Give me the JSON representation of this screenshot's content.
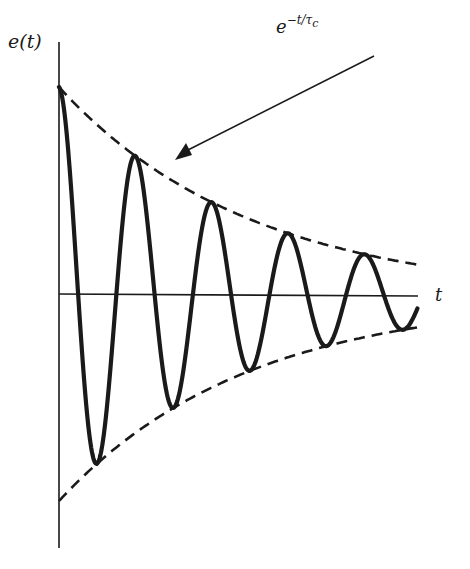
{
  "diagram": {
    "y_axis_label": "e(t)",
    "x_axis_label": "t",
    "envelope_label": {
      "base": "e",
      "exponent": "−t/τ",
      "subscript": "c"
    },
    "colors": {
      "stroke": "#1a1a1a",
      "background": "#ffffff"
    }
  },
  "chart_data": {
    "type": "line",
    "title": "",
    "xlabel": "t",
    "ylabel": "e(t)",
    "series": [
      {
        "name": "e(t) damped cosine",
        "style": "solid-thick"
      },
      {
        "name": "upper envelope e^(-t/τc)",
        "style": "dashed"
      },
      {
        "name": "lower envelope -e^(-t/τc)",
        "style": "dashed"
      }
    ],
    "peaks_relative_amplitude": [
      1.0,
      0.71,
      0.52,
      0.37,
      0.27
    ],
    "troughs_relative_amplitude": [
      -0.84,
      -0.61,
      -0.44,
      -0.34,
      -0.26
    ],
    "cycles_shown": 4.7,
    "annotation": "arrow pointing to upper envelope labeled e^(−t/τc)",
    "grid": false
  }
}
